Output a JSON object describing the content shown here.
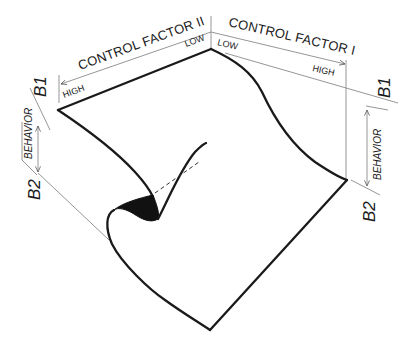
{
  "diagram": {
    "type": "cusp-catastrophe-surface",
    "axes": {
      "control_factor_2": {
        "label": "CONTROL FACTOR II",
        "low_label": "LOW",
        "high_label": "HIGH"
      },
      "control_factor_1": {
        "label": "CONTROL FACTOR I",
        "low_label": "LOW",
        "high_label": "HIGH"
      },
      "behavior_left": {
        "label": "BEHAVIOR",
        "top_label": "B1",
        "bottom_label": "B2"
      },
      "behavior_right": {
        "label": "BEHAVIOR",
        "top_label": "B1",
        "bottom_label": "B2"
      }
    },
    "colors": {
      "surface_outline": "#1a1a1a",
      "guide_lines": "#8a8a8a",
      "fold_shading": "#111111",
      "background": "#ffffff"
    }
  }
}
